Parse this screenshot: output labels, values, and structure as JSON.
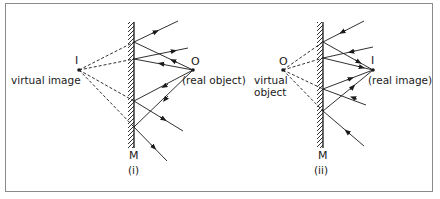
{
  "figure": {
    "colors": {
      "ink": "#1a1a1a",
      "border": "#8a8a8a",
      "background": "#ffffff"
    },
    "panels": [
      {
        "id": "i",
        "caption": "(i)",
        "mirror_label": "M",
        "image_point_label": "I",
        "image_description": "virtual image",
        "object_point_label": "O",
        "object_description": "(real object)"
      },
      {
        "id": "ii",
        "caption": "(ii)",
        "mirror_label": "M",
        "object_point_label": "O",
        "object_description_line1": "virtual",
        "object_description_line2": "object",
        "image_point_label": "I",
        "image_description": "(real image)"
      }
    ]
  }
}
